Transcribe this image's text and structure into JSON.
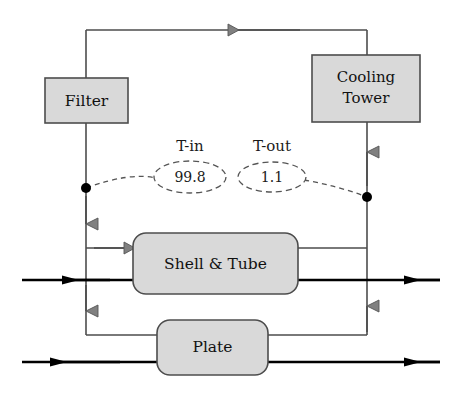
{
  "diagram": {
    "type": "process-flow-diagram",
    "colors": {
      "box_fill": "#d9d9d9",
      "box_stroke": "#4d4d4d",
      "pipe_thin": "#4d4d4d",
      "pipe_thick": "#000000",
      "arrow_gray": "#808080",
      "arrow_black": "#000000",
      "dot": "#000000",
      "dashed": "#555555",
      "text": "#111111"
    },
    "equipment": [
      {
        "id": "filter",
        "label": "Filter",
        "shape": "rect",
        "x": 45,
        "y": 78,
        "w": 83,
        "h": 45
      },
      {
        "id": "cooling-tower",
        "label": "Cooling Tower",
        "label_line1": "Cooling",
        "label_line2": "Tower",
        "shape": "rect",
        "x": 312,
        "y": 55,
        "w": 108,
        "h": 67
      },
      {
        "id": "shell-and-tube",
        "label": "Shell & Tube",
        "shape": "rounded-rect",
        "x": 133,
        "y": 233,
        "w": 165,
        "h": 61
      },
      {
        "id": "plate",
        "label": "Plate",
        "shape": "rounded-rect",
        "x": 157,
        "y": 320,
        "w": 111,
        "h": 55
      }
    ],
    "measurements": [
      {
        "id": "t-in",
        "label": "T-in",
        "value": "99.8",
        "cx": 190,
        "cy": 177,
        "rx": 36,
        "ry": 16,
        "label_x": 190,
        "label_y": 147
      },
      {
        "id": "t-out",
        "label": "T-out",
        "value": "1.1",
        "cx": 272,
        "cy": 177,
        "rx": 34,
        "ry": 15,
        "label_x": 272,
        "label_y": 147
      }
    ],
    "junctions": [
      {
        "id": "t-in-tap",
        "cx": 86,
        "cy": 188,
        "r": 5
      },
      {
        "id": "t-out-tap",
        "cx": 367,
        "cy": 197,
        "r": 5
      }
    ],
    "streams": [
      {
        "id": "shell-tube-process",
        "label": "",
        "y": 280,
        "direction": "left"
      },
      {
        "id": "plate-process",
        "label": "",
        "y": 362,
        "direction": "left"
      }
    ]
  }
}
